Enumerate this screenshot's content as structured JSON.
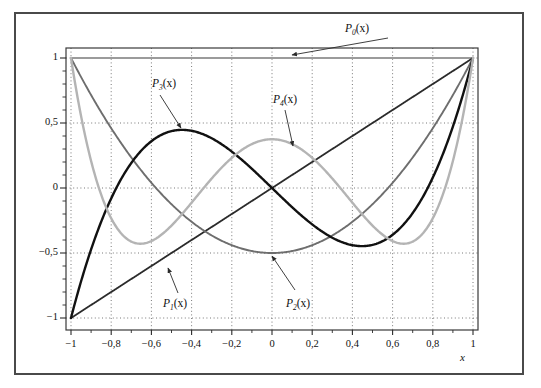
{
  "figure": {
    "background_color": "#ffffff",
    "border_color": "#4a4a4a",
    "plot_frame_color": "#3a3a3a",
    "grid_color": "#555555"
  },
  "chart_data": {
    "type": "line",
    "title": "",
    "subtitle": "",
    "xlabel": "x",
    "ylabel": "",
    "xlim": [
      -1,
      1
    ],
    "ylim": [
      -1,
      1
    ],
    "grid": true,
    "grid_style": "dotted",
    "legend_position": "inline-annotations",
    "x_ticks": [
      -1,
      -0.8,
      -0.6,
      -0.4,
      -0.2,
      0,
      0.2,
      0.4,
      0.6,
      0.8,
      1
    ],
    "x_tick_labels": [
      "−1",
      "−0,8",
      "−0,6",
      "−0,4",
      "−0,2",
      "0",
      "0,2",
      "0,4",
      "0,6",
      "0,8",
      "1"
    ],
    "y_ticks": [
      -1,
      -0.5,
      0,
      0.5,
      1
    ],
    "y_tick_labels": [
      "−1",
      "−0,5",
      "0",
      "0,5",
      "1"
    ],
    "y_minor_tick_step": 0.1,
    "series": [
      {
        "name": "P0",
        "label": "P",
        "subscript": "0",
        "arg": "(x)",
        "color": "#9b9b9b",
        "width": 2.2,
        "formula": "1",
        "x": [
          -1,
          -0.8,
          -0.6,
          -0.4,
          -0.2,
          0,
          0.2,
          0.4,
          0.6,
          0.8,
          1
        ],
        "values": [
          1,
          1,
          1,
          1,
          1,
          1,
          1,
          1,
          1,
          1,
          1
        ]
      },
      {
        "name": "P1",
        "label": "P",
        "subscript": "1",
        "arg": "(x)",
        "color": "#2b2b2b",
        "width": 1.8,
        "formula": "x",
        "x": [
          -1,
          -0.8,
          -0.6,
          -0.4,
          -0.2,
          0,
          0.2,
          0.4,
          0.6,
          0.8,
          1
        ],
        "values": [
          -1,
          -0.8,
          -0.6,
          -0.4,
          -0.2,
          0,
          0.2,
          0.4,
          0.6,
          0.8,
          1
        ]
      },
      {
        "name": "P2",
        "label": "P",
        "subscript": "2",
        "arg": "(x)",
        "color": "#6e6e6e",
        "width": 1.9,
        "formula": "(3x^2 - 1)/2",
        "x": [
          -1,
          -0.8,
          -0.6,
          -0.4,
          -0.2,
          0,
          0.2,
          0.4,
          0.6,
          0.8,
          1
        ],
        "values": [
          1,
          0.46,
          0.04,
          -0.26,
          -0.44,
          -0.5,
          -0.44,
          -0.26,
          0.04,
          0.46,
          1
        ]
      },
      {
        "name": "P3",
        "label": "P",
        "subscript": "3",
        "arg": "(x)",
        "color": "#111111",
        "width": 2.4,
        "formula": "(5x^3 - 3x)/2",
        "x": [
          -1,
          -0.8,
          -0.6,
          -0.4,
          -0.2,
          0,
          0.2,
          0.4,
          0.6,
          0.8,
          1
        ],
        "values": [
          -1,
          0.08,
          0.36,
          0.44,
          0.28,
          0,
          -0.28,
          -0.44,
          -0.36,
          -0.08,
          1
        ]
      },
      {
        "name": "P4",
        "label": "P",
        "subscript": "4",
        "arg": "(x)",
        "color": "#b4b4b4",
        "width": 2.4,
        "formula": "(35x^4 - 30x^2 + 3)/8",
        "x": [
          -1,
          -0.8,
          -0.6,
          -0.4,
          -0.2,
          0,
          0.2,
          0.4,
          0.6,
          0.8,
          1
        ],
        "values": [
          1,
          -0.233,
          -0.408,
          0.113,
          0.345,
          0.375,
          0.345,
          0.113,
          -0.408,
          -0.233,
          1
        ]
      }
    ],
    "annotations": [
      {
        "name": "P0-annotation",
        "text_label": "P",
        "sub": "0",
        "arg": "(x)",
        "label_x": 345,
        "label_y": 22,
        "arrow_from_x": 388,
        "arrow_from_y": 38,
        "arrow_to_x": 292,
        "arrow_to_y": 55
      },
      {
        "name": "P3-annotation",
        "text_label": "P",
        "sub": "3",
        "arg": "(x)",
        "label_x": 152,
        "label_y": 77,
        "arrow_from_x": 160,
        "arrow_from_y": 95,
        "arrow_to_x": 181,
        "arrow_to_y": 128
      },
      {
        "name": "P4-annotation",
        "text_label": "P",
        "sub": "4",
        "arg": "(x)",
        "label_x": 273,
        "label_y": 93,
        "arrow_from_x": 285,
        "arrow_from_y": 110,
        "arrow_to_x": 293,
        "arrow_to_y": 146
      },
      {
        "name": "P1-annotation",
        "text_label": "P",
        "sub": "1",
        "arg": "(x)",
        "label_x": 163,
        "label_y": 297,
        "arrow_from_x": 178,
        "arrow_from_y": 293,
        "arrow_to_x": 168,
        "arrow_to_y": 268
      },
      {
        "name": "P2-annotation",
        "text_label": "P",
        "sub": "2",
        "arg": "(x)",
        "label_x": 286,
        "label_y": 297,
        "arrow_from_x": 295,
        "arrow_from_y": 290,
        "arrow_to_x": 272,
        "arrow_to_y": 256
      }
    ]
  }
}
